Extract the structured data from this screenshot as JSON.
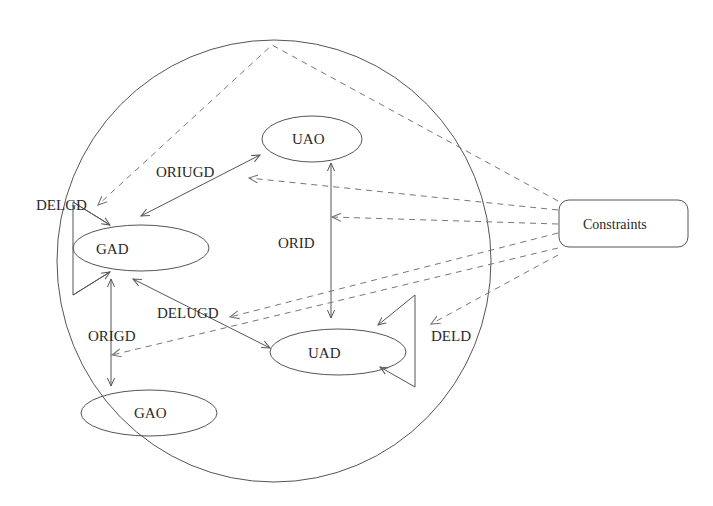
{
  "diagram": {
    "nodes": {
      "uao": "UAO",
      "gad": "GAD",
      "uad": "UAD",
      "gao": "GAO",
      "constraints": "Constraints"
    },
    "edges": {
      "oriugd": "ORIUGD",
      "delgd": "DELGD",
      "orid": "ORID",
      "delugd": "DELUGD",
      "origd": "ORIGD",
      "deld": "DELD"
    },
    "colors": {
      "stroke": "#555555",
      "dashed": "#777777",
      "text": "#2a2a2a"
    }
  }
}
